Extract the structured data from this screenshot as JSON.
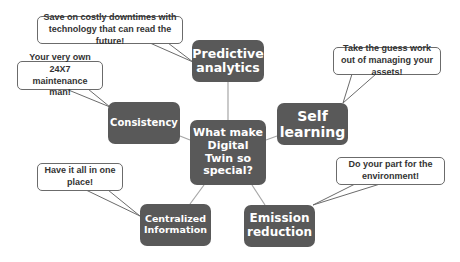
{
  "diagram": {
    "center": {
      "label": "What make Digital Twin so special?"
    },
    "nodes": [
      {
        "id": "predictive",
        "label": "Predictive analytics"
      },
      {
        "id": "consistency",
        "label": "Consistency"
      },
      {
        "id": "self-learning",
        "label": "Self learning"
      },
      {
        "id": "centralized",
        "label": "Centralized Information"
      },
      {
        "id": "emission",
        "label": "Emission reduction"
      }
    ],
    "callouts": [
      {
        "for": "predictive",
        "text": "Save on costly downtimes with technology that can read the future!"
      },
      {
        "for": "consistency",
        "text": "Your very own 24X7 maintenance man!"
      },
      {
        "for": "self-learning",
        "text": "Take the guess work out of managing your assets!"
      },
      {
        "for": "centralized",
        "text": "Have it all in one place!"
      },
      {
        "for": "emission",
        "text": "Do your part for the environment!"
      }
    ],
    "colors": {
      "node_fill": "#595959",
      "node_text": "#ffffff",
      "connector": "#a6a6a6",
      "callout_border": "#6b6b6b",
      "callout_text": "#333333"
    }
  }
}
